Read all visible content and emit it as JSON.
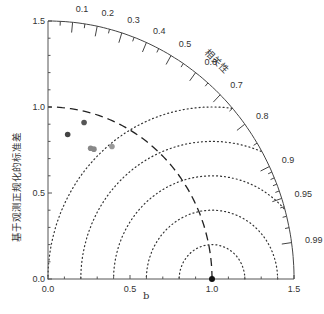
{
  "chart_data": {
    "type": "taylor_diagram",
    "title": "",
    "xlabel": "b",
    "ylabel": "基于观测正规化的标准差",
    "correlation_label": "相关性",
    "std_max": 1.5,
    "x_ticks": [
      "0.0",
      "0.5",
      "1.0",
      "1.5"
    ],
    "y_ticks": [
      "0.0",
      "0.5",
      "1.0",
      "1.5"
    ],
    "correlation_ticks": [
      "0.1",
      "0.2",
      "0.3",
      "0.4",
      "0.5",
      "0.6",
      "0.7",
      "0.8",
      "0.9",
      "0.95",
      "0.99"
    ],
    "rms_arcs": [
      0.2,
      0.4,
      0.6,
      0.8,
      1.0
    ],
    "reference_std_arc": 1.0,
    "reference_point": {
      "x": 1.0,
      "y": 0.0
    },
    "points": [
      {
        "x": 0.12,
        "y": 0.84,
        "color": "#444444"
      },
      {
        "x": 0.22,
        "y": 0.91,
        "color": "#555555"
      },
      {
        "x": 0.26,
        "y": 0.76,
        "color": "#888888"
      },
      {
        "x": 0.28,
        "y": 0.755,
        "color": "#888888"
      },
      {
        "x": 0.39,
        "y": 0.77,
        "color": "#999999"
      }
    ],
    "colors": {
      "axis": "#555555",
      "arc": "#444444",
      "dotted": "#333333",
      "dashed": "#222222"
    }
  }
}
